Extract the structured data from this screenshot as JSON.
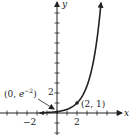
{
  "chart_data": {
    "type": "line",
    "title": "",
    "function": "y = e^(x-2)",
    "xlabel": "x",
    "ylabel": "y",
    "series": [
      {
        "name": "curve",
        "x": [
          -2,
          -1,
          0,
          1,
          2,
          3,
          4
        ],
        "y": [
          0.018,
          0.05,
          0.135,
          0.368,
          1,
          2.718,
          7.389
        ]
      }
    ],
    "xlim": [
      -5.5,
      6.3
    ],
    "ylim": [
      -2,
      11
    ],
    "x_ticks": [
      -2,
      2
    ],
    "y_ticks": [
      2
    ],
    "annotations": [
      {
        "text": "(0, e^-2)",
        "point": [
          0,
          0.135
        ],
        "arrow": true
      },
      {
        "text": "(2, 1)",
        "point": [
          2,
          1
        ]
      }
    ],
    "grid": false
  },
  "labels": {
    "x_axis": "x",
    "y_axis": "y",
    "tick_x_neg2": "−2",
    "tick_x_2": "2",
    "tick_y_2": "2",
    "point_a_prefix": "(0, ",
    "point_a_e": "e",
    "point_a_exp": "−2",
    "point_a_suffix": ")",
    "point_b": "(2, 1)"
  },
  "colors": {
    "ink": "#222222",
    "background": "#ffffff"
  }
}
